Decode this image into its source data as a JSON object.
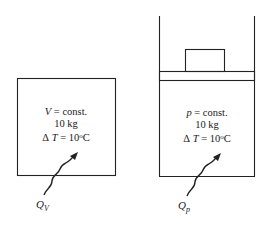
{
  "left_system": {
    "var": "V",
    "line1_rest": " = const.",
    "mass": "10 kg",
    "delta": "Δ",
    "T": "T",
    "dt_eq": " = 10",
    "deg": "o",
    "unit": "C",
    "heat_Q": "Q",
    "heat_sub": "V"
  },
  "right_system": {
    "var": "p",
    "line1_rest": " = const.",
    "mass": "10 kg",
    "delta": "Δ",
    "T": "T",
    "dt_eq": " = 10",
    "deg": "o",
    "unit": "C",
    "heat_Q": "Q",
    "heat_sub": "p"
  }
}
